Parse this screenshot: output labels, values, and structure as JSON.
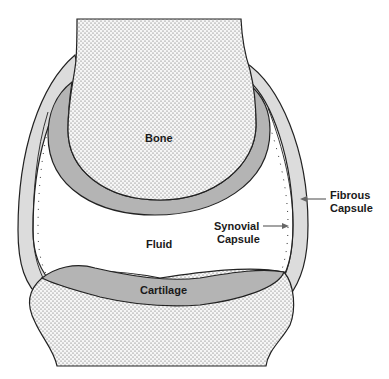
{
  "labels": {
    "bone": "Bone",
    "fluid": "Fluid",
    "cartilage": "Cartilage",
    "synovial_line1": "Synovial",
    "synovial_line2": "Capsule",
    "fibrous_line1": "Fibrous",
    "fibrous_line2": "Capsule"
  },
  "colors": {
    "bone_fill": "#f4f4f4",
    "stipple": "#555555",
    "cartilage": "#b4b4b4",
    "fibrous_capsule": "#dcdcdc",
    "outline": "#222222",
    "arrow": "#666666",
    "background": "#ffffff"
  }
}
